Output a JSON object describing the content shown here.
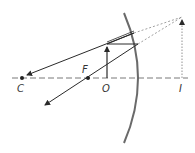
{
  "diagram": {
    "labels": {
      "C": "C",
      "F": "F",
      "O": "O",
      "I": "I"
    },
    "colors": {
      "ray": "#2a2a2a",
      "mirror": "#6a6a6a",
      "axis": "#555555",
      "virtual": "#777777"
    }
  }
}
